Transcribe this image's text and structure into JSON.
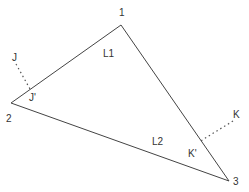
{
  "diagram": {
    "type": "triangle-with-perpendiculars",
    "colors": {
      "line": "#444444",
      "text": "#333333",
      "background": "#ffffff"
    },
    "vertices": [
      {
        "id": "1",
        "label": "1",
        "x": 121,
        "y": 25,
        "lx": 119,
        "ly": 16
      },
      {
        "id": "2",
        "label": "2",
        "x": 11,
        "y": 103,
        "lx": 6,
        "ly": 122
      },
      {
        "id": "3",
        "label": "3",
        "x": 229,
        "y": 181,
        "lx": 233,
        "ly": 185
      }
    ],
    "edges": [
      {
        "id": "L1",
        "label": "L1",
        "lx": 103,
        "ly": 57
      },
      {
        "id": "L2",
        "label": "L2",
        "lx": 152,
        "ly": 145
      }
    ],
    "points": [
      {
        "id": "J",
        "label": "J",
        "lx": 12,
        "ly": 61
      },
      {
        "id": "J'",
        "label": "J'",
        "lx": 29,
        "ly": 101
      },
      {
        "id": "K",
        "label": "K",
        "lx": 233,
        "ly": 118
      },
      {
        "id": "K'",
        "label": "K'",
        "lx": 188,
        "ly": 157
      }
    ],
    "projections": [
      {
        "from": "J",
        "to": "J'",
        "x1": 16,
        "y1": 64,
        "x2": 30,
        "y2": 89
      },
      {
        "from": "K",
        "to": "K'",
        "x1": 233,
        "y1": 121,
        "x2": 199,
        "y2": 142
      }
    ]
  }
}
